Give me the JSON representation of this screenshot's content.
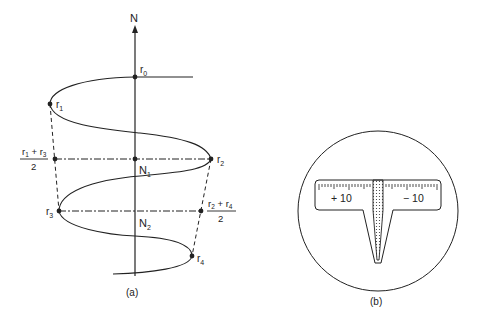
{
  "figure_a": {
    "axis_label": "N",
    "points": {
      "r0": {
        "main": "r",
        "sub": "0"
      },
      "r1": {
        "main": "r",
        "sub": "1"
      },
      "r2": {
        "main": "r",
        "sub": "2"
      },
      "r3": {
        "main": "r",
        "sub": "3"
      },
      "r4": {
        "main": "r",
        "sub": "4"
      }
    },
    "n1": {
      "main": "N",
      "sub": "1"
    },
    "n2": {
      "main": "N",
      "sub": "2"
    },
    "mean13": {
      "num_a": "r",
      "sub_a": "1",
      "plus": " + ",
      "num_b": "r",
      "sub_b": "3",
      "den": "2"
    },
    "mean24": {
      "num_a": "r",
      "sub_a": "2",
      "plus": " + ",
      "num_b": "r",
      "sub_b": "4",
      "den": "2"
    },
    "caption": "(a)"
  },
  "figure_b": {
    "scale_left": "+ 10",
    "scale_right": "− 10",
    "caption": "(b)"
  },
  "colors": {
    "ink": "#222222",
    "background": "#ffffff"
  }
}
